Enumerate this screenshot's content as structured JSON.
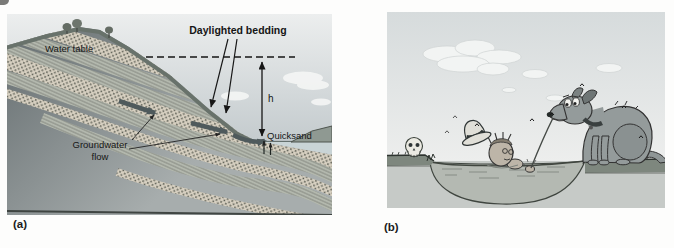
{
  "figure": {
    "panel_a": {
      "caption": "(a)",
      "labels": {
        "daylighted_bedding": "Daylighted bedding",
        "water_table": "Water table",
        "groundwater_line1": "Groundwater",
        "groundwater_line2": "flow",
        "quicksand": "Quicksand",
        "height_symbol": "h"
      }
    },
    "panel_b": {
      "caption": "(b)"
    },
    "colors": {
      "sky_top": "#eceeee",
      "sky_bottom": "#c3cacd",
      "rock_dark": "#6d7577",
      "rock_light": "#a7adad",
      "dotted_bed": "#d7d0c1",
      "lined_bed": "#bcc0b6",
      "slope_surface": "#68726b",
      "pond_water": "#c9d4d6",
      "flow_arrow": "#4f5a5c",
      "annotation": "#161616",
      "cartoon_sky_top": "#d6dbdc",
      "cartoon_sky_bottom": "#edeeed",
      "grass_bank": "#7e877e",
      "subsurface": "#c6cac7",
      "quicksand_pit": "#b4b9b2",
      "dog_body": "#949b9b",
      "skull": "#ebeae2",
      "hat": "#e0dfd8"
    }
  }
}
